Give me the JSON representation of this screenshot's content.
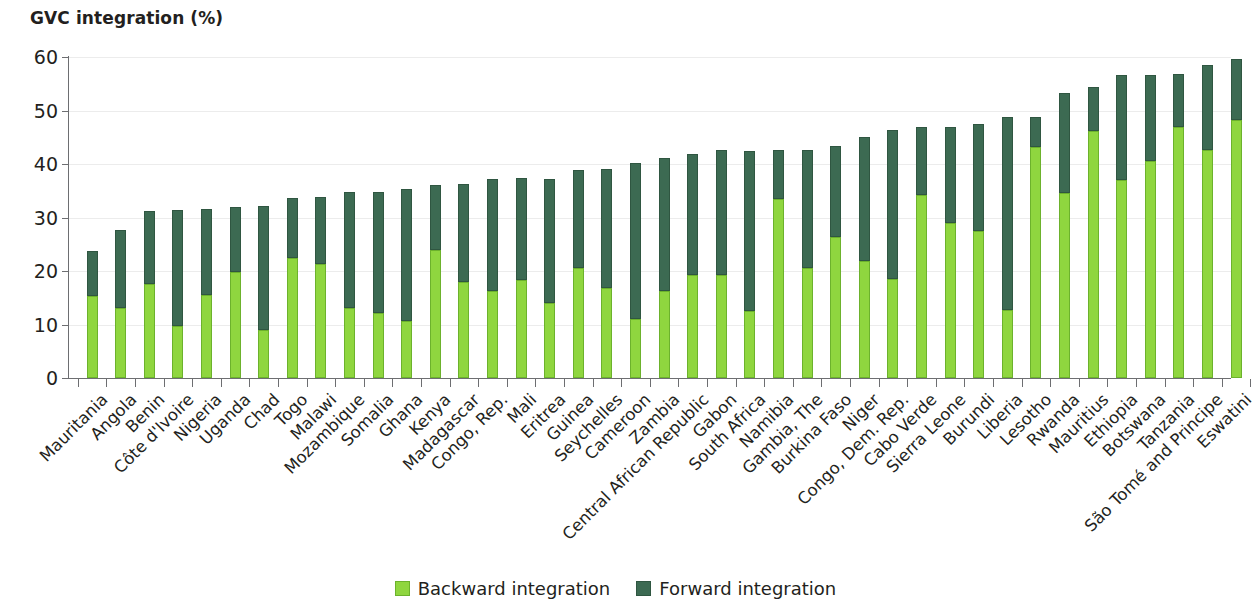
{
  "chart_data": {
    "type": "bar",
    "title": "GVC integration (%)",
    "xlabel": "",
    "ylabel": "",
    "ylim": [
      0,
      60
    ],
    "yticks": [
      0,
      10,
      20,
      30,
      40,
      50,
      60
    ],
    "stacked": true,
    "grid": true,
    "legend_position": "bottom-center",
    "colors": {
      "backward": "#8fd63f",
      "forward": "#3c6a52"
    },
    "categories": [
      "Mauritania",
      "Angola",
      "Benin",
      "Côte d'Ivoire",
      "Nigeria",
      "Uganda",
      "Chad",
      "Togo",
      "Malawi",
      "Mozambique",
      "Somalia",
      "Ghana",
      "Kenya",
      "Madagascar",
      "Congo, Rep.",
      "Mali",
      "Eritrea",
      "Guinea",
      "Seychelles",
      "Cameroon",
      "Zambia",
      "Central African Republic",
      "Gabon",
      "South Africa",
      "Namibia",
      "Gambia, The",
      "Burkina Faso",
      "Niger",
      "Congo, Dem. Rep.",
      "Cabo Verde",
      "Sierra Leone",
      "Burundi",
      "Liberia",
      "Lesotho",
      "Rwanda",
      "Mauritius",
      "Ethiopia",
      "Botswana",
      "Tanzania",
      "São Tomé and Principe",
      "Eswatini"
    ],
    "series": [
      {
        "name": "Backward integration",
        "color": "#8fd63f",
        "values": [
          15.3,
          13.0,
          17.5,
          9.8,
          15.5,
          19.9,
          9.0,
          22.5,
          21.4,
          13.0,
          12.2,
          10.7,
          24.0,
          18.0,
          16.2,
          18.3,
          14.0,
          20.6,
          16.8,
          11.0,
          16.3,
          19.2,
          19.2,
          12.5,
          33.5,
          20.6,
          26.4,
          21.8,
          18.5,
          34.3,
          28.9,
          27.4,
          12.8,
          43.2,
          34.5,
          46.2,
          37.0,
          40.6,
          47.0,
          42.7,
          48.2
        ]
      },
      {
        "name": "Forward integration",
        "color": "#3c6a52",
        "values": [
          8.4,
          14.7,
          13.8,
          21.6,
          16.0,
          12.1,
          23.2,
          11.1,
          12.5,
          21.7,
          22.6,
          24.6,
          12.0,
          18.2,
          21.0,
          19.0,
          23.2,
          18.3,
          22.2,
          29.2,
          24.8,
          22.6,
          23.4,
          30.0,
          9.2,
          22.0,
          16.9,
          23.2,
          27.9,
          12.6,
          18.1,
          20.1,
          36.0,
          5.6,
          18.8,
          8.2,
          19.6,
          16.1,
          9.8,
          15.9,
          11.4
        ]
      }
    ],
    "totals": [
      23.7,
      27.7,
      31.3,
      31.4,
      31.5,
      32.0,
      32.2,
      33.6,
      33.9,
      34.7,
      34.8,
      35.3,
      36.0,
      36.2,
      37.2,
      37.3,
      37.2,
      38.9,
      39.0,
      40.2,
      41.1,
      41.8,
      42.6,
      42.5,
      42.7,
      42.6,
      43.3,
      45.0,
      46.4,
      46.9,
      47.0,
      47.5,
      48.8,
      48.8,
      53.3,
      54.4,
      56.6,
      56.7,
      56.8,
      58.6,
      59.6
    ]
  },
  "legend": {
    "items": [
      {
        "label": "Backward integration",
        "swatch": "backward"
      },
      {
        "label": "Forward integration",
        "swatch": "forward"
      }
    ]
  }
}
